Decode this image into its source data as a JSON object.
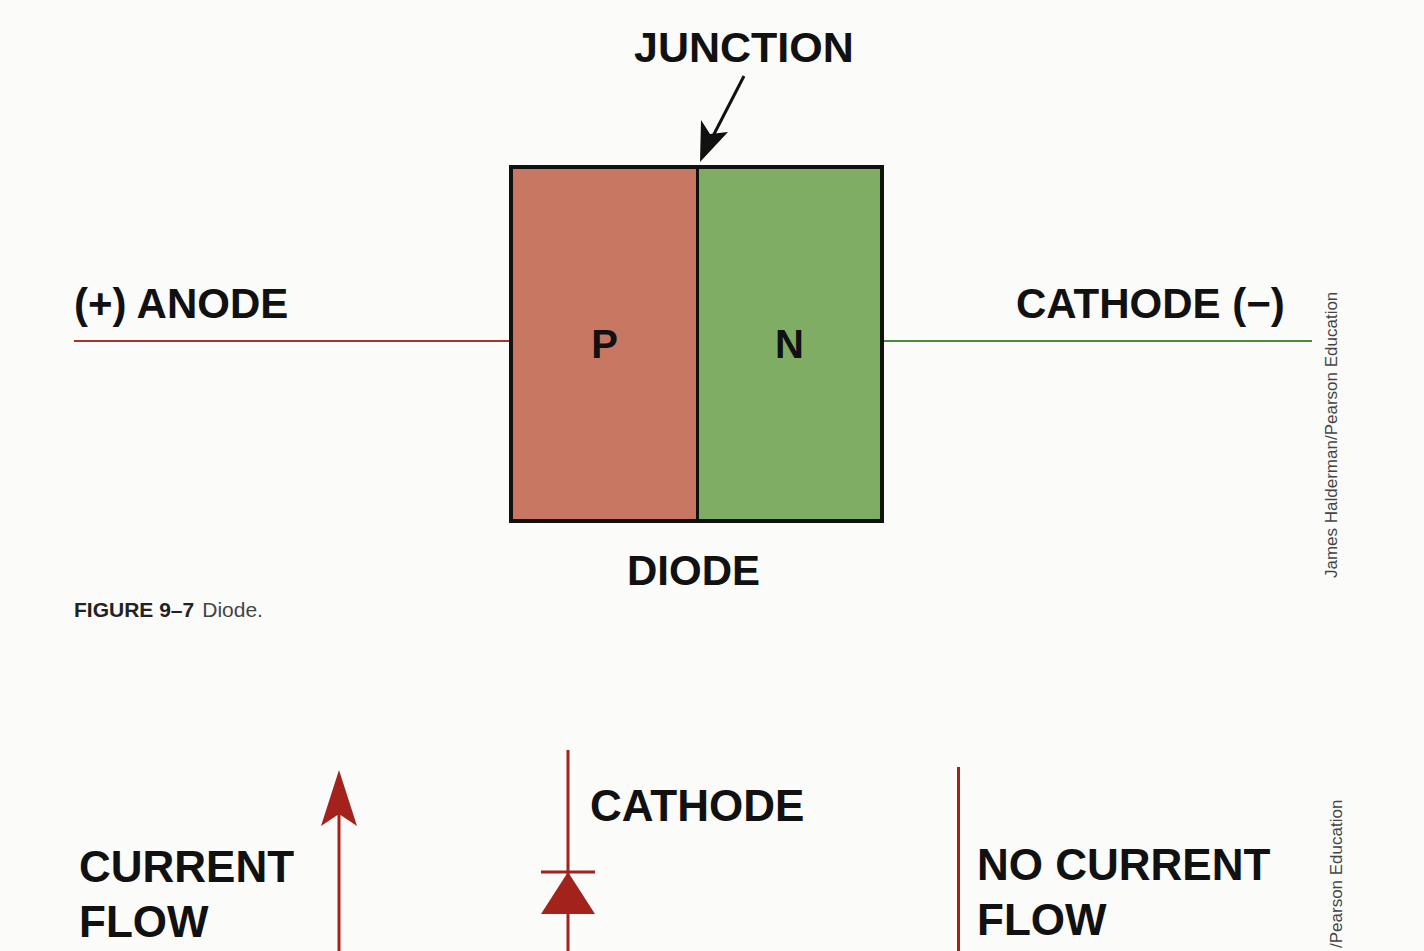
{
  "diagram": {
    "junction_label": "JUNCTION",
    "anode_label": "(+) ANODE",
    "cathode_label": "CATHODE (−)",
    "p_region_label": "P",
    "n_region_label": "N",
    "device_label": "DIODE",
    "colors": {
      "p_region": "#c87862",
      "n_region": "#7ead63",
      "anode_wire": "#a8332a",
      "cathode_wire": "#4a8a3a",
      "outline": "#111111"
    }
  },
  "caption": {
    "figure_number": "FIGURE 9–7",
    "figure_text": "Diode."
  },
  "credits": {
    "top": "James Halderman/Pearson Education",
    "bottom": "/Pearson Education"
  },
  "lower_figure": {
    "current_flow_line1": "CURRENT",
    "current_flow_line2": "FLOW",
    "cathode_label": "CATHODE",
    "no_current_line1": "NO CURRENT",
    "no_current_line2": "FLOW",
    "colors": {
      "symbol": "#a3231c"
    }
  }
}
